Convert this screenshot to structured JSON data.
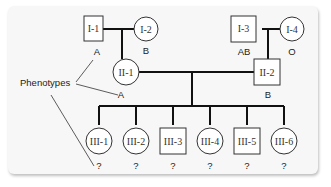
{
  "diagram": {
    "type": "pedigree",
    "legend_label": "Phenotypes",
    "individuals": [
      {
        "id": "I-1",
        "sex": "male",
        "phenotype": "A"
      },
      {
        "id": "I-2",
        "sex": "female",
        "phenotype": "B"
      },
      {
        "id": "I-3",
        "sex": "male",
        "phenotype": "AB"
      },
      {
        "id": "I-4",
        "sex": "female",
        "phenotype": "O"
      },
      {
        "id": "II-1",
        "sex": "female",
        "phenotype": "A"
      },
      {
        "id": "II-2",
        "sex": "male",
        "phenotype": "B"
      },
      {
        "id": "III-1",
        "sex": "female",
        "phenotype": "?"
      },
      {
        "id": "III-2",
        "sex": "female",
        "phenotype": "?"
      },
      {
        "id": "III-3",
        "sex": "male",
        "phenotype": "?"
      },
      {
        "id": "III-4",
        "sex": "female",
        "phenotype": "?"
      },
      {
        "id": "III-5",
        "sex": "male",
        "phenotype": "?"
      },
      {
        "id": "III-6",
        "sex": "female",
        "phenotype": "?"
      }
    ],
    "matings": [
      {
        "parents": [
          "I-1",
          "I-2"
        ],
        "children": [
          "II-1"
        ]
      },
      {
        "parents": [
          "I-3",
          "I-4"
        ],
        "children": [
          "II-2"
        ]
      },
      {
        "parents": [
          "II-1",
          "II-2"
        ],
        "children": [
          "III-1",
          "III-2",
          "III-3",
          "III-4",
          "III-5",
          "III-6"
        ]
      }
    ]
  }
}
